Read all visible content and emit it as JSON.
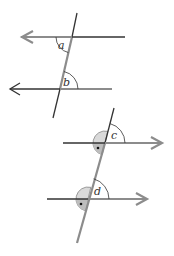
{
  "diagram": {
    "type": "parallel-lines-angles",
    "colors": {
      "black_line": "#333333",
      "gray_line": "#8c8c8c",
      "shade": "#d9d9d9",
      "background": "#ffffff"
    },
    "top_figure": {
      "angle_labels": {
        "a": "a",
        "b": "b"
      },
      "description": "Two parallel lines with left-pointing arrows cut by a transversal; angles a and b marked"
    },
    "bottom_figure": {
      "angle_labels": {
        "c": "c",
        "d": "d"
      },
      "description": "Two parallel lines with right-pointing arrows cut by a transversal; angles c and d marked, supplementary angles shaded with dot"
    }
  }
}
